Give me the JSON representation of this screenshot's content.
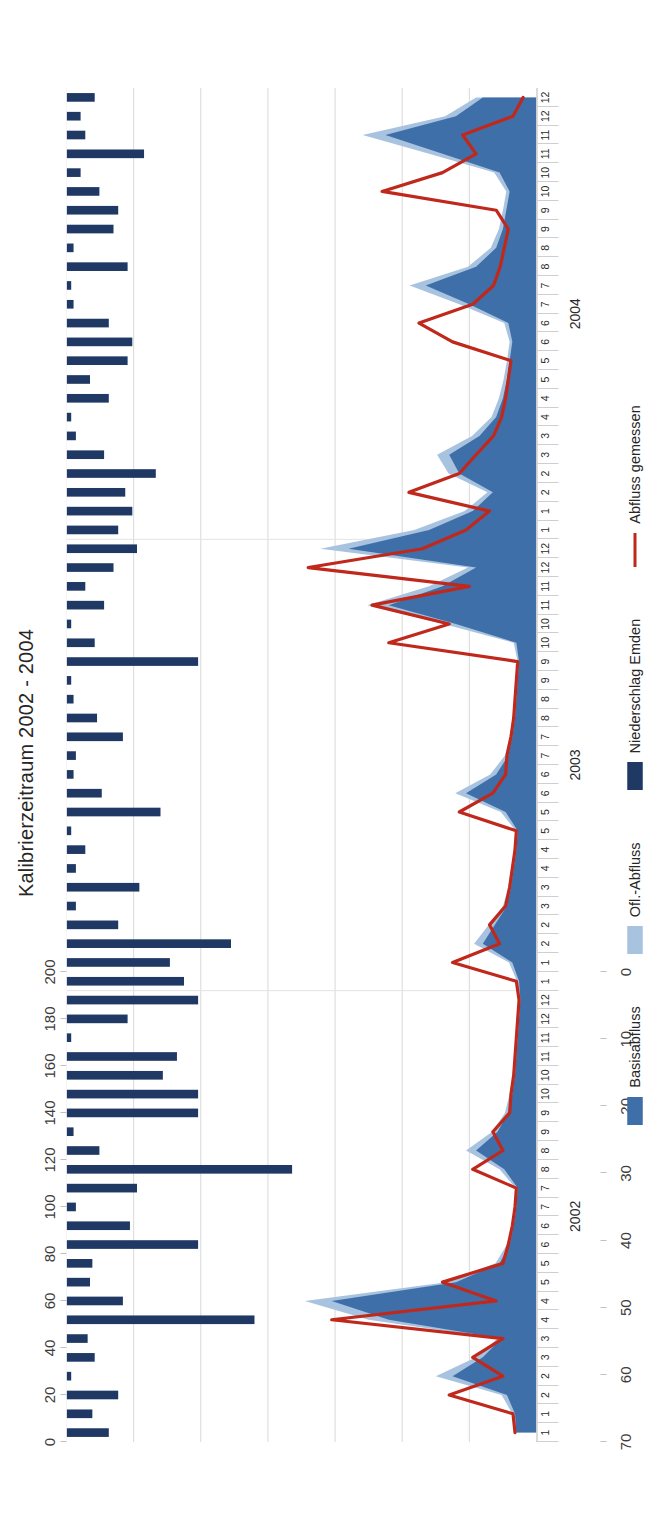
{
  "chart_data": {
    "type": "area",
    "title": "Kalibrierzeitraum 2002 - 2004",
    "xlabel": "",
    "ylabel": "",
    "grid": true,
    "legend_position": "bottom",
    "orientation": "rotated-90-ccw",
    "axes": {
      "precipitation": {
        "name": "Niederschlag Emden",
        "position": "top",
        "reversed": true,
        "range": [
          0,
          200
        ],
        "ticks": [
          0,
          20,
          40,
          60,
          80,
          100,
          120,
          140,
          160,
          180,
          200
        ],
        "tick_labels": [
          "0",
          "20",
          "40",
          "60",
          "80",
          "100",
          "120",
          "140",
          "160",
          "180",
          "200"
        ]
      },
      "discharge": {
        "name": "Abfluss",
        "position": "bottom",
        "reversed": false,
        "range": [
          0,
          70
        ],
        "ticks": [
          0,
          10,
          20,
          30,
          40,
          50,
          60,
          70
        ],
        "tick_labels": [
          "0",
          "10",
          "20",
          "30",
          "40",
          "50",
          "60",
          "70"
        ]
      }
    },
    "years": [
      {
        "label": "2002",
        "start_index": 0,
        "end_index": 23
      },
      {
        "label": "2003",
        "start_index": 24,
        "end_index": 47
      },
      {
        "label": "2004",
        "start_index": 48,
        "end_index": 71
      }
    ],
    "categories": [
      "1",
      "1",
      "2",
      "2",
      "3",
      "3",
      "4",
      "4",
      "5",
      "5",
      "6",
      "6",
      "7",
      "7",
      "8",
      "8",
      "9",
      "9",
      "10",
      "10",
      "11",
      "11",
      "12",
      "12",
      "1",
      "1",
      "2",
      "2",
      "3",
      "3",
      "4",
      "4",
      "5",
      "5",
      "6",
      "6",
      "7",
      "7",
      "8",
      "8",
      "9",
      "9",
      "10",
      "10",
      "11",
      "11",
      "12",
      "12",
      "1",
      "1",
      "2",
      "2",
      "3",
      "3",
      "4",
      "4",
      "5",
      "5",
      "6",
      "6",
      "7",
      "7",
      "8",
      "8",
      "9",
      "9",
      "10",
      "10",
      "11",
      "11",
      "12",
      "12"
    ],
    "series": [
      {
        "name": "Basisabfluss",
        "type": "area",
        "color": "#3f6fa8",
        "axis": "discharge",
        "values": [
          3.0,
          3.2,
          4.4,
          12.5,
          8.0,
          5.2,
          22.0,
          30.5,
          12.0,
          5.5,
          4.0,
          3.4,
          3.0,
          2.8,
          4.8,
          9.0,
          5.8,
          4.2,
          3.6,
          3.2,
          3.0,
          2.8,
          2.6,
          2.4,
          2.6,
          3.6,
          8.0,
          6.2,
          4.4,
          3.8,
          3.4,
          3.0,
          2.8,
          4.6,
          10.5,
          6.0,
          4.2,
          3.6,
          3.2,
          3.0,
          2.8,
          2.6,
          3.0,
          12.0,
          22.0,
          14.0,
          9.0,
          28.0,
          16.0,
          9.5,
          6.5,
          11.5,
          13.0,
          8.5,
          6.0,
          5.0,
          4.4,
          4.0,
          3.6,
          4.2,
          10.0,
          16.5,
          9.0,
          6.0,
          5.0,
          4.5,
          4.0,
          5.5,
          14.0,
          22.5,
          12.0,
          8.0
        ]
      },
      {
        "name": "Ofl.-Abfluss",
        "type": "area",
        "color": "#a8c3e0",
        "axis": "discharge",
        "values": [
          0.3,
          0.4,
          0.8,
          2.5,
          1.0,
          0.6,
          3.0,
          4.0,
          1.4,
          0.6,
          0.4,
          0.3,
          0.3,
          0.3,
          0.7,
          1.5,
          0.8,
          0.5,
          0.4,
          0.3,
          0.3,
          0.3,
          0.2,
          0.2,
          0.3,
          0.5,
          1.3,
          0.9,
          0.6,
          0.4,
          0.4,
          0.3,
          0.3,
          0.7,
          1.6,
          0.9,
          0.5,
          0.4,
          0.3,
          0.3,
          0.3,
          0.2,
          0.4,
          1.8,
          3.2,
          2.0,
          1.2,
          4.2,
          2.2,
          1.2,
          0.8,
          1.6,
          1.8,
          1.1,
          0.7,
          0.6,
          0.5,
          0.4,
          0.4,
          0.6,
          1.5,
          2.4,
          1.2,
          0.8,
          0.6,
          0.5,
          0.5,
          0.8,
          2.0,
          3.4,
          1.6,
          1.0
        ]
      },
      {
        "name": "Abfluss gemessen",
        "type": "line",
        "color": "#c0281c",
        "axis": "discharge",
        "values": [
          3.2,
          3.5,
          13.0,
          5.0,
          9.5,
          5.0,
          30.5,
          6.0,
          14.0,
          5.0,
          4.2,
          3.6,
          3.2,
          3.0,
          9.5,
          5.0,
          6.5,
          4.0,
          3.8,
          3.4,
          3.2,
          3.0,
          2.8,
          2.6,
          3.0,
          12.5,
          5.5,
          7.0,
          4.6,
          4.0,
          3.6,
          3.2,
          3.0,
          11.5,
          6.5,
          4.6,
          4.4,
          3.8,
          3.4,
          3.2,
          3.0,
          2.8,
          22.0,
          13.0,
          24.5,
          10.0,
          34.0,
          17.0,
          10.5,
          7.0,
          19.0,
          11.5,
          9.0,
          6.4,
          5.2,
          4.6,
          4.2,
          3.8,
          12.5,
          17.5,
          9.5,
          6.4,
          5.4,
          4.8,
          4.2,
          6.0,
          23.0,
          14.0,
          9.0,
          11.0,
          3.5,
          2.0
        ]
      },
      {
        "name": "Niederschlag Emden",
        "type": "bar",
        "color": "#1f3864",
        "axis": "precipitation",
        "values": [
          18,
          11,
          22,
          2,
          12,
          9,
          80,
          24,
          10,
          11,
          56,
          27,
          4,
          30,
          96,
          14,
          3,
          56,
          56,
          41,
          47,
          2,
          26,
          56,
          50,
          44,
          70,
          22,
          4,
          31,
          4,
          8,
          2,
          40,
          15,
          3,
          4,
          24,
          13,
          3,
          2,
          56,
          12,
          2,
          16,
          8,
          20,
          30,
          22,
          28,
          25,
          38,
          16,
          4,
          2,
          18,
          10,
          26,
          28,
          18,
          3,
          2,
          26,
          3,
          20,
          22,
          14,
          6,
          33,
          8,
          6,
          12
        ]
      }
    ],
    "legend": [
      {
        "label": "Basisabfluss",
        "color": "#3f6fa8",
        "marker": "box"
      },
      {
        "label": "Ofl.-Abfluss",
        "color": "#a8c3e0",
        "marker": "box"
      },
      {
        "label": "Niederschlag Emden",
        "color": "#1f3864",
        "marker": "box"
      },
      {
        "label": "Abfluss gemessen",
        "color": "#c0281c",
        "marker": "line"
      }
    ]
  },
  "colors": {
    "base_flow": "#3f6fa8",
    "surface_flow": "#a8c3e0",
    "precipitation": "#1f3864",
    "measured_discharge": "#c0281c",
    "grid": "#d9d9d9",
    "text": "#262626"
  }
}
